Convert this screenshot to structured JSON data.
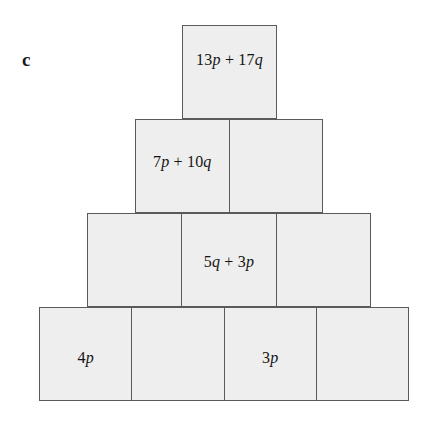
{
  "figure": {
    "part_label": "c",
    "fill_color": "#eeeeee",
    "border_color": "#5a5a5a",
    "text_color": "#141414",
    "background_color": "#ffffff",
    "rows": [
      {
        "index": 1,
        "cells": [
          {
            "text": "13p + 17q",
            "empty": false
          }
        ]
      },
      {
        "index": 2,
        "cells": [
          {
            "text": "7p + 10q",
            "empty": false
          },
          {
            "text": "",
            "empty": true
          }
        ]
      },
      {
        "index": 3,
        "cells": [
          {
            "text": "",
            "empty": true
          },
          {
            "text": "5q + 3p",
            "empty": false
          },
          {
            "text": "",
            "empty": true
          }
        ]
      },
      {
        "index": 4,
        "cells": [
          {
            "text": "4p",
            "empty": false
          },
          {
            "text": "",
            "empty": true
          },
          {
            "text": "3p",
            "empty": false
          },
          {
            "text": "",
            "empty": true
          }
        ]
      }
    ]
  }
}
